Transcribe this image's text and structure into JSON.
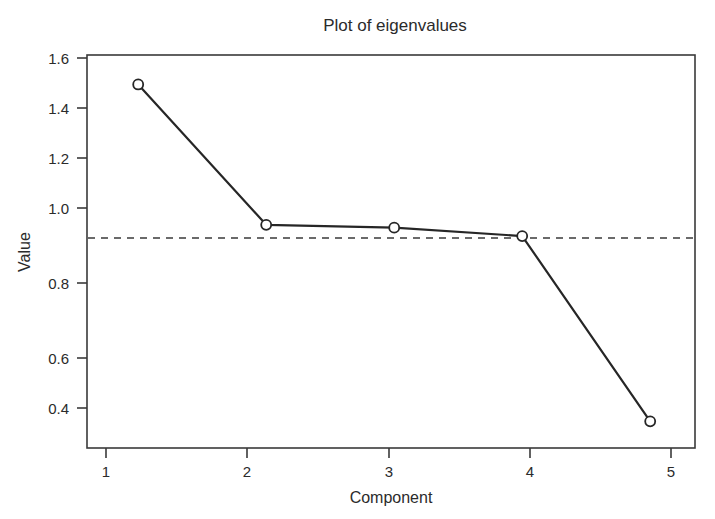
{
  "chart_data": {
    "type": "line",
    "title": "Plot of eigenvalues",
    "xlabel": "Component",
    "ylabel": "Value",
    "x": [
      1,
      2,
      3,
      4,
      5
    ],
    "values": [
      1.55,
      1.05,
      1.04,
      1.01,
      0.35
    ],
    "categories": [
      "1",
      "2",
      "3",
      "4",
      "5"
    ],
    "xticks": [
      "1",
      "2",
      "3",
      "4",
      "5"
    ],
    "yticks": [
      "0.4",
      "0.6",
      "0.8",
      "1.0",
      "1.2",
      "1.4",
      "1.6"
    ],
    "ytick_values": [
      0.4,
      0.6,
      0.8,
      1.0,
      1.2,
      1.4,
      1.6
    ],
    "xlim": [
      0.6,
      5.35
    ],
    "ylim": [
      0.255,
      1.655
    ],
    "grid": false,
    "legend": "none",
    "marker": "open-circle",
    "annotations": [
      {
        "name": "eigenvalue-one-reference-line",
        "type": "horizontal-dashed-line",
        "y": 1.0,
        "label": ""
      }
    ],
    "series": [
      {
        "name": "eigenvalues",
        "values": [
          1.55,
          1.05,
          1.04,
          1.01,
          0.35
        ]
      }
    ],
    "colors": {
      "line": "#262626",
      "marker_fill": "#ffffff",
      "marker_stroke": "#262626",
      "frame": "#3a3a3a",
      "reference_line": "#3a3a3a",
      "text": "#2b2b2b",
      "background": "#ffffff"
    }
  }
}
